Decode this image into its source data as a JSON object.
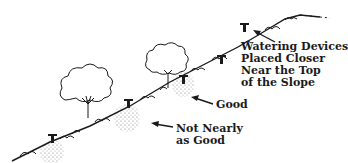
{
  "diagram": {
    "labels": {
      "top": [
        "Watering Devices",
        "Placed Closer",
        "Near the Top",
        "of the Slope"
      ],
      "good": "Good",
      "not_good": [
        "Not Nearly",
        "as Good"
      ]
    },
    "elements": {
      "slope": "hillside ground line with groundcover shrubs",
      "trees": 2,
      "watering_devices": 5,
      "water_zones": 3
    },
    "colors": {
      "ink": "#1a1a1a",
      "stipple": "#888888",
      "background": "#ffffff"
    }
  }
}
